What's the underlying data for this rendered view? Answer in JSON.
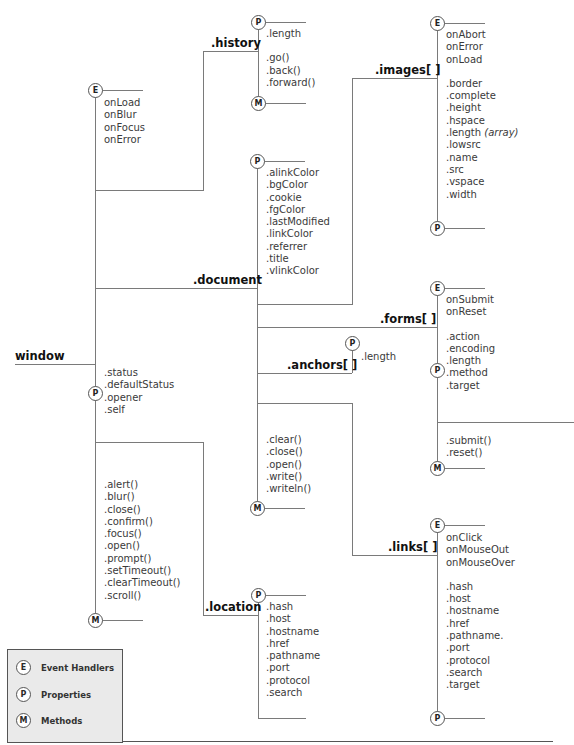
{
  "root": {
    "label": "window"
  },
  "window": {
    "events": [
      "onLoad",
      "onBlur",
      "onFocus",
      "onError"
    ],
    "properties": [
      ".status",
      ".defaultStatus",
      ".opener",
      ".self"
    ],
    "methods": [
      ".alert()",
      ".blur()",
      ".close()",
      ".confirm()",
      ".focus()",
      ".open()",
      ".prompt()",
      ".setTimeout()",
      ".clearTimeout()",
      ".scroll()"
    ]
  },
  "history": {
    "label": ".history",
    "properties": [
      ".length"
    ],
    "methods": [
      ".go()",
      ".back()",
      ".forward()"
    ]
  },
  "document": {
    "label": ".document",
    "properties": [
      ".alinkColor",
      ".bgColor",
      ".cookie",
      ".fgColor",
      ".lastModified",
      ".linkColor",
      ".referrer",
      ".title",
      ".vlinkColor"
    ],
    "methods": [
      ".clear()",
      ".close()",
      ".open()",
      ".write()",
      ".writeln()"
    ]
  },
  "images": {
    "label": ".images[ ]",
    "events": [
      "onAbort",
      "onError",
      "onLoad"
    ],
    "properties": [
      ".border",
      ".complete",
      ".height",
      ".hspace",
      ".length",
      ".lowsrc",
      ".name",
      ".src",
      ".vspace",
      ".width"
    ],
    "length_note": "(array)"
  },
  "forms": {
    "label": ".forms[ ]",
    "events": [
      "onSubmit",
      "onReset"
    ],
    "properties": [
      ".action",
      ".encoding",
      ".length",
      ".method",
      ".target"
    ],
    "methods": [
      ".submit()",
      ".reset()"
    ]
  },
  "anchors": {
    "label": ".anchors[ ]",
    "properties": [
      ".length"
    ]
  },
  "links": {
    "label": ".links[ ]",
    "events": [
      "onClick",
      "onMouseOut",
      "onMouseOver"
    ],
    "properties": [
      ".hash",
      ".host",
      ".hostname",
      ".href",
      ".pathname.",
      ".port",
      ".protocol",
      ".search",
      ".target"
    ]
  },
  "location": {
    "label": ".location",
    "properties": [
      ".hash",
      ".host",
      ".hostname",
      ".href",
      ".pathname",
      ".port",
      ".protocol",
      ".search"
    ]
  },
  "markers": {
    "E": "E",
    "P": "P",
    "M": "M"
  },
  "legend": {
    "items": [
      {
        "marker": "E",
        "label": "Event Handlers"
      },
      {
        "marker": "P",
        "label": "Properties"
      },
      {
        "marker": "M",
        "label": "Methods"
      }
    ]
  }
}
